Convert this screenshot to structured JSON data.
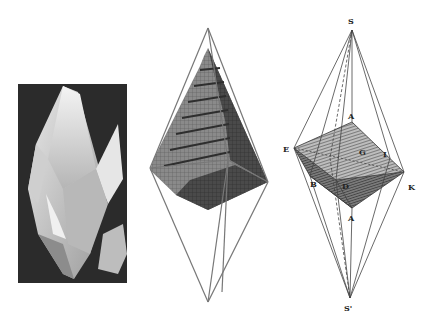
{
  "figure": {
    "panels": [
      {
        "id": "photo",
        "description": "Photograph of a calcite scalenohedral crystal on dark background"
      },
      {
        "id": "pyramid",
        "description": "Stacked-cube (molecule) model of a scalenohedron inside its outline"
      },
      {
        "id": "geom",
        "description": "Geometric construction of the scalenohedron from a rhombohedron"
      }
    ],
    "labels": {
      "S_top": "S",
      "A_top": "A",
      "E": "E",
      "G": "G",
      "I": "I",
      "B": "B",
      "D": "D",
      "K": "K",
      "A_bottom": "A",
      "S_bottom": "S'"
    },
    "colors": {
      "background": "#ffffff",
      "photo_bg": "#2b2b2b",
      "line": "#555555",
      "hatch_dark": "#3a3a3a"
    }
  }
}
